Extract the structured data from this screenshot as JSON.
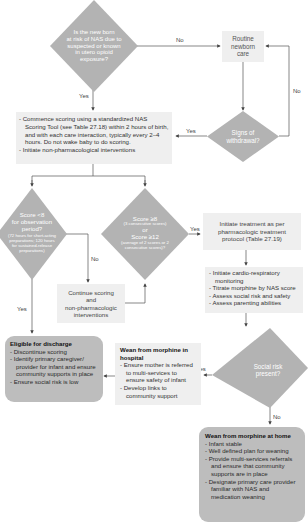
{
  "flowchart": {
    "start_question": {
      "lines": [
        "Is the new born",
        "at risk of NAS due to",
        "suspected or known",
        "in utero opioid",
        "exposure?"
      ]
    },
    "routine_care": {
      "lines": [
        "Routine",
        "newborn",
        "care"
      ]
    },
    "signs_withdrawal": {
      "lines": [
        "Signs of",
        "withdrawal?"
      ]
    },
    "scoring_box": {
      "items": [
        "- Commence scoring using a standardized NAS Scoring Tool (see Table 27.18) within 2 hours of birth, and with each care interaction, typically every 2–4 hours. Do not wake baby to do scoring.",
        "- Initiate non-pharmacological interventions"
      ]
    },
    "score_lt8": {
      "line1": "Score <8",
      "line2": "for observation",
      "line3": "period?",
      "note": "(72 hours for short-acting preparations; 120 hours for sustained-release preparations)"
    },
    "score_ge8": {
      "line1": "Score ≥8",
      "note1": "(3 consecutive scores)",
      "or": "or",
      "line2": "Score ≥12",
      "note2": "(average of 2 scores or 2 consecutive scores)?"
    },
    "continue_scoring": {
      "lines": [
        "Continue scoring",
        "and",
        "non-pharmacologic",
        "interventions"
      ]
    },
    "initiate_treatment": {
      "lines": [
        "Initiate treatment as per",
        "pharmacologic treatment",
        "protocol (Table 27.19)"
      ]
    },
    "monitoring_box": {
      "items": [
        "- Initiate cardio-respiratory monitoring",
        "- Titrate morphine by NAS score",
        "- Assess social risk and safety",
        "- Assess parenting abilities"
      ]
    },
    "social_risk": {
      "lines": [
        "Social risk",
        "present?"
      ]
    },
    "eligible_discharge": {
      "title": "Eligible for discharge",
      "items": [
        "- Discontinue scoring",
        "- Identify primary caregiver/ provider for infant and ensure community supports in place",
        "- Ensure social risk is low"
      ]
    },
    "wean_hospital": {
      "title": "Wean from morphine in hospital",
      "items": [
        "- Ensure mother is referred to multi-services to ensure safety of infant",
        "- Develop links to community support"
      ]
    },
    "wean_home": {
      "title": "Wean from morphine at home",
      "items": [
        "- Infant stable",
        "- Well defined plan for weaning",
        "- Provide multi-services referrals and ensure that community supports are in place",
        "- Designate primary care provider familiar with NAS and medication weaning"
      ]
    },
    "labels": {
      "start_no": "No",
      "start_yes": "Yes",
      "withdrawal_no": "No",
      "withdrawal_yes": "Yes",
      "lt8_yes": "Yes",
      "lt8_no": "No",
      "ge8_yes": "Yes",
      "social_yes": "Yes",
      "social_no": "No"
    },
    "colors": {
      "diamond": "#b3b3b3",
      "box_light": "#efefef",
      "box_rounded": "#bdbdbd",
      "line": "#555555"
    }
  }
}
